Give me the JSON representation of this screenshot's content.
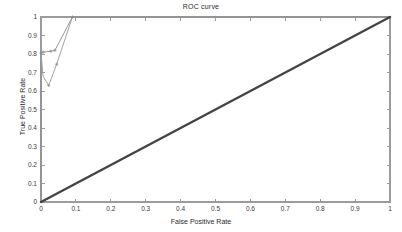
{
  "chart_data": {
    "type": "line",
    "title": "ROC curve",
    "xlabel": "False Positive Rate",
    "ylabel": "True Positive Rate",
    "xlim": [
      0,
      1
    ],
    "ylim": [
      0,
      1
    ],
    "grid": false,
    "legend": "none",
    "xticks": [
      "0",
      "0.1",
      "0.2",
      "0.3",
      "0.4",
      "0.5",
      "0.6",
      "0.7",
      "0.8",
      "0.9",
      "1"
    ],
    "xtick_values": [
      0,
      0.1,
      0.2,
      0.3,
      0.4,
      0.5,
      0.6,
      0.7,
      0.8,
      0.9,
      1
    ],
    "yticks": [
      "0",
      "0.1",
      "0.2",
      "0.3",
      "0.4",
      "0.5",
      "0.6",
      "0.7",
      "0.8",
      "0.9",
      "1"
    ],
    "ytick_values": [
      0,
      0.1,
      0.2,
      0.3,
      0.4,
      0.5,
      0.6,
      0.7,
      0.8,
      0.9,
      1
    ],
    "series": [
      {
        "name": "roc-curve-a",
        "style": "line-with-markers",
        "color": "#8c8c8c",
        "x": [
          0,
          0,
          0.006,
          0.028,
          0.04,
          0.09,
          1
        ],
        "y": [
          0,
          0.805,
          0.81,
          0.815,
          0.82,
          1,
          1
        ]
      },
      {
        "name": "roc-curve-b",
        "style": "line-with-markers",
        "color": "#9a9a9a",
        "x": [
          0,
          0.006,
          0.022,
          0.045,
          0.09
        ],
        "y": [
          0.805,
          0.68,
          0.63,
          0.745,
          1
        ]
      },
      {
        "name": "chance-diagonal",
        "style": "line",
        "color": "#444444",
        "x": [
          0,
          1
        ],
        "y": [
          0,
          1
        ]
      }
    ],
    "markers": [
      {
        "x": 0,
        "y": 0.805
      },
      {
        "x": 0.006,
        "y": 0.81
      },
      {
        "x": 0.028,
        "y": 0.815
      },
      {
        "x": 0.04,
        "y": 0.82
      },
      {
        "x": 0.022,
        "y": 0.63
      },
      {
        "x": 0.045,
        "y": 0.745
      },
      {
        "x": 0.09,
        "y": 1.0
      }
    ],
    "colors": {
      "background": "#ffffff",
      "axis": "#9b9b9b",
      "text": "#2b2b2b",
      "curve": "#8c8c8c",
      "diagonal": "#444444"
    }
  },
  "plot_box": {
    "left": 41,
    "top": 17,
    "right": 390,
    "bottom": 202
  }
}
